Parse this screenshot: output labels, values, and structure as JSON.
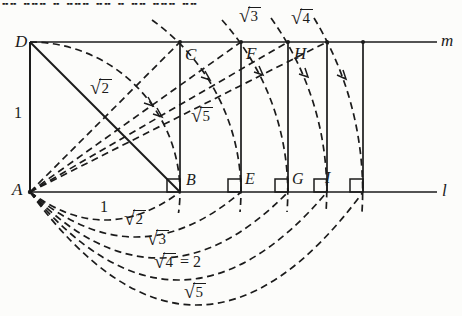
{
  "colors": {
    "ink": "#1b1b1b",
    "paper": "#fcfcfa"
  },
  "top_strip": {
    "fragment": "╍╍ ╍╍╍ ╍ ╍╍╍ ╍╍ ╍ ╍╍ ╍╍╍ ╍╍"
  },
  "lines": {
    "top_label": "m",
    "bottom_label": "l"
  },
  "points": {
    "D": "D",
    "C": "C",
    "F": "F",
    "H": "H",
    "A": "A",
    "B": "B",
    "E": "E",
    "G": "G",
    "I": "I"
  },
  "measures": {
    "side_left": "1",
    "diagonal": {
      "sign": "√",
      "radicand": "2"
    },
    "hypotenuse_sqrt5": {
      "sign": "√",
      "radicand": "5"
    },
    "arc_top_sqrt3": {
      "sign": "√",
      "radicand": "3"
    },
    "arc_top_sqrt4": {
      "sign": "√",
      "radicand": "4"
    },
    "below": [
      {
        "text": "1"
      },
      {
        "sign": "√",
        "radicand": "2"
      },
      {
        "sign": "√",
        "radicand": "3"
      },
      {
        "sign": "√",
        "radicand": "4",
        "suffix": "= 2"
      },
      {
        "sign": "√",
        "radicand": "5"
      }
    ]
  }
}
